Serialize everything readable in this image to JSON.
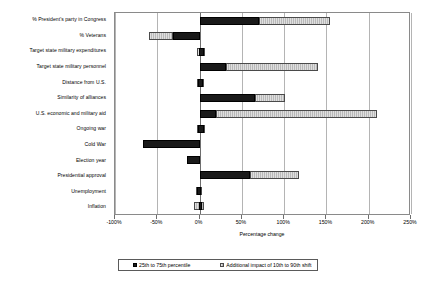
{
  "chart_data": {
    "type": "bar",
    "orientation": "horizontal",
    "title": "",
    "xlabel": "Percentage change",
    "ylabel": "",
    "xlim": [
      -100,
      250
    ],
    "xticks": [
      -100,
      -50,
      0,
      50,
      100,
      150,
      200,
      250
    ],
    "xticklabels": [
      "-100%",
      "-50%",
      "0%",
      "50%",
      "100%",
      "150%",
      "200%",
      "250%"
    ],
    "grid": true,
    "legend_position": "bottom",
    "stacked": true,
    "categories": [
      "% President's party in Congress",
      "% Veterans",
      "Target state military expenditures",
      "Target state military personnel",
      "Distance from U.S.",
      "Similarity of alliances",
      "U.S. economic and military aid",
      "Ongoing war",
      "Cold War",
      "Election year",
      "Presidential approval",
      "Unemployment",
      "Inflation"
    ],
    "series": [
      {
        "name": "25th to 75th percentile",
        "color": "#1a1a1a",
        "spans": [
          [
            0,
            70
          ],
          [
            -31,
            0
          ],
          [
            -1,
            5
          ],
          [
            0,
            31
          ],
          [
            -2,
            4
          ],
          [
            0,
            66
          ],
          [
            0,
            20
          ],
          [
            -2,
            5
          ],
          [
            -67,
            0
          ],
          [
            -15,
            0
          ],
          [
            0,
            60
          ],
          [
            -3,
            2
          ],
          [
            -1,
            3
          ]
        ]
      },
      {
        "name": "Additional impact of 10th to 90th shift",
        "color": "#b9b9b9",
        "spans": [
          [
            70,
            154
          ],
          [
            -60,
            -31
          ],
          [
            -3,
            6
          ],
          [
            31,
            140
          ],
          [
            -3,
            5
          ],
          [
            66,
            101
          ],
          [
            20,
            210
          ],
          [
            -3,
            6
          ],
          [
            -67,
            -67
          ],
          [
            -15,
            -15
          ],
          [
            60,
            118
          ],
          [
            -4,
            3
          ],
          [
            -6,
            5
          ]
        ]
      }
    ]
  },
  "axis": {
    "x_title": "Percentage change"
  },
  "legend": {
    "items": [
      {
        "label": "25th to 75th percentile",
        "swatch": "dark-swatch"
      },
      {
        "label": "Additional impact of 10th to 90th shift",
        "swatch": "hatched-swatch"
      }
    ]
  }
}
